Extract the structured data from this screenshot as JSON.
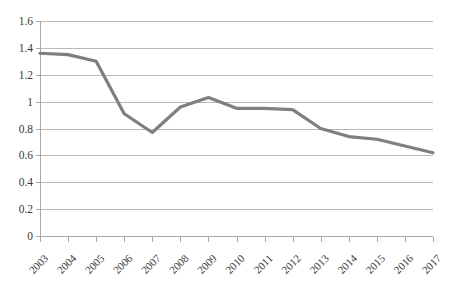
{
  "chart_data": {
    "type": "line",
    "title": "",
    "subtitle": "",
    "xlabel": "",
    "ylabel": "",
    "categories": [
      "2003",
      "2004",
      "2005",
      "2006",
      "2007",
      "2008",
      "2009",
      "2010",
      "2011",
      "2012",
      "2013",
      "2014",
      "2015",
      "2016",
      "2017"
    ],
    "values": [
      1.36,
      1.35,
      1.3,
      0.91,
      0.77,
      0.96,
      1.03,
      0.95,
      0.95,
      0.94,
      0.8,
      0.74,
      0.72,
      0.67,
      0.62
    ],
    "series": [
      {
        "name": "series-1",
        "values": [
          1.36,
          1.35,
          1.3,
          0.91,
          0.77,
          0.96,
          1.03,
          0.95,
          0.95,
          0.94,
          0.8,
          0.74,
          0.72,
          0.67,
          0.62
        ]
      }
    ],
    "ylim": [
      0,
      1.6
    ],
    "ytick_values": [
      0,
      0.2,
      0.4,
      0.6,
      0.8,
      1,
      1.2,
      1.4,
      1.6
    ],
    "ytick_labels": [
      "0",
      "0.2",
      "0.4",
      "0.6",
      "0.8",
      "1",
      "1.2",
      "1.4",
      "1.6"
    ],
    "xtick_labels": [
      "2003",
      "2004",
      "2005",
      "2006",
      "2007",
      "2008",
      "2009",
      "2010",
      "2011",
      "2012",
      "2013",
      "2014",
      "2015",
      "2016",
      "2017"
    ],
    "xtick_rotation_deg": -45,
    "grid": {
      "horizontal": true,
      "vertical": false
    },
    "legend": {
      "visible": false,
      "position": "none"
    },
    "annotations": [],
    "colors": {
      "line": "#7f7f7f",
      "gridline": "#b8b8b8",
      "axis": "#a8a8a8",
      "tick_text": "#3a3a3a",
      "background": "#ffffff"
    }
  },
  "plot_geometry": {
    "left": 40,
    "right": 433,
    "top": 21,
    "bottom": 236
  }
}
